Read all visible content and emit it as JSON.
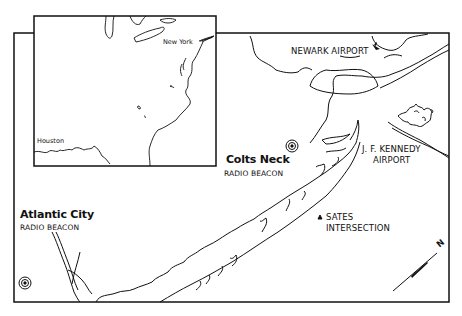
{
  "map": {
    "type": "aviation-locator-map",
    "colors": {
      "ink": "#111111",
      "paper": "#ffffff"
    },
    "inset": {
      "labels": {
        "new_york": "New York",
        "houston": "Houston"
      }
    },
    "labels": {
      "newark_airport": "NEWARK AIRPORT",
      "jfk_line1": "J. F. KENNEDY",
      "jfk_line2": "AIRPORT",
      "colts_neck_name": "Colts Neck",
      "colts_neck_type": "RADIO BEACON",
      "atlantic_city_name": "Atlantic City",
      "atlantic_city_type": "RADIO BEACON",
      "sates_line1": "SATES",
      "sates_line2": "INTERSECTION",
      "north_arrow": "N"
    },
    "symbols": [
      {
        "name": "radio-beacon-colts-neck",
        "icon": "radio-beacon-icon"
      },
      {
        "name": "radio-beacon-atlantic-city",
        "icon": "radio-beacon-icon"
      },
      {
        "name": "sates-intersection",
        "icon": "triangle-icon"
      },
      {
        "name": "newark-airport",
        "icon": "airplane-icon"
      }
    ]
  }
}
